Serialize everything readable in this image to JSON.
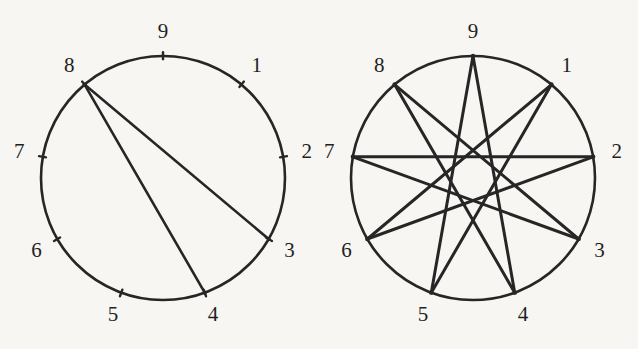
{
  "figure": {
    "name": "nonagon-chord-diagrams",
    "background_color": "#f7f6f3",
    "stroke_color": "#262626",
    "label_color": "#1f1f1f",
    "vertex_count": 9,
    "vertex_labels": [
      "1",
      "2",
      "3",
      "4",
      "5",
      "6",
      "7",
      "8",
      "9"
    ],
    "panels": [
      {
        "id": "left",
        "name": "partial-chord-circle",
        "center": {
          "x": 163,
          "y": 178
        },
        "radius": 122,
        "circle_stroke_width": 2.6,
        "chord_stroke_width": 2.6,
        "tick_length": 7,
        "show_ticks": true,
        "show_vertex_dots": false,
        "chords": [
          {
            "from": 8,
            "to": 3
          },
          {
            "from": 8,
            "to": 4
          }
        ],
        "label_radius_offset": 24
      },
      {
        "id": "right",
        "name": "nonagram-star-circle",
        "center": {
          "x": 473,
          "y": 178
        },
        "radius": 122,
        "circle_stroke_width": 2.6,
        "chord_stroke_width": 3.0,
        "tick_length": 0,
        "show_ticks": false,
        "show_vertex_dots": true,
        "step": 4,
        "chords": [
          {
            "from": 1,
            "to": 5
          },
          {
            "from": 5,
            "to": 9
          },
          {
            "from": 9,
            "to": 4
          },
          {
            "from": 4,
            "to": 8
          },
          {
            "from": 8,
            "to": 3
          },
          {
            "from": 3,
            "to": 7
          },
          {
            "from": 7,
            "to": 2
          },
          {
            "from": 2,
            "to": 6
          },
          {
            "from": 6,
            "to": 1
          }
        ],
        "label_radius_offset": 24
      }
    ]
  },
  "chart_data": {
    "type": "diagram",
    "title": "",
    "vertex_angles_deg": {
      "9": -90,
      "1": -50,
      "2": -10,
      "3": 30,
      "4": 70,
      "5": 110,
      "6": 150,
      "7": 190,
      "8": 230
    },
    "series": [
      {
        "name": "left-circle-chords",
        "values": [
          [
            8,
            3
          ],
          [
            8,
            4
          ]
        ]
      },
      {
        "name": "right-circle-chords",
        "values": [
          [
            1,
            5
          ],
          [
            5,
            9
          ],
          [
            9,
            4
          ],
          [
            4,
            8
          ],
          [
            8,
            3
          ],
          [
            3,
            7
          ],
          [
            7,
            2
          ],
          [
            2,
            6
          ],
          [
            6,
            1
          ]
        ]
      }
    ]
  }
}
